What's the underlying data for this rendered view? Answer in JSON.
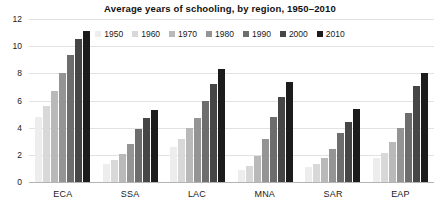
{
  "chart_data": {
    "type": "bar",
    "title": "Average years of schooling, by region, 1950–2010",
    "xlabel": "",
    "ylabel": "",
    "ylim": [
      0,
      12
    ],
    "yticks": [
      0,
      2,
      4,
      6,
      8,
      10,
      12
    ],
    "grid": true,
    "legend_position": "top-center",
    "categories": [
      "ECA",
      "SSA",
      "LAC",
      "MNA",
      "SAR",
      "EAP"
    ],
    "series": [
      {
        "name": "1950",
        "color": "#ededed",
        "values": [
          4.8,
          1.3,
          2.6,
          0.85,
          1.1,
          1.75
        ]
      },
      {
        "name": "1960",
        "color": "#d8d8d8",
        "values": [
          5.6,
          1.6,
          3.2,
          1.2,
          1.3,
          2.15
        ]
      },
      {
        "name": "1970",
        "color": "#b9b9b9",
        "values": [
          6.7,
          2.05,
          3.95,
          1.9,
          1.75,
          2.95
        ]
      },
      {
        "name": "1980",
        "color": "#949494",
        "values": [
          8.0,
          2.8,
          4.7,
          3.15,
          2.45,
          4.0
        ]
      },
      {
        "name": "1990",
        "color": "#6d6d6d",
        "values": [
          9.35,
          3.9,
          6.0,
          4.8,
          3.6,
          5.05
        ]
      },
      {
        "name": "2000",
        "color": "#464646",
        "values": [
          10.5,
          4.7,
          7.2,
          6.25,
          4.4,
          7.05
        ]
      },
      {
        "name": "2010",
        "color": "#1c1c1c",
        "values": [
          11.1,
          5.3,
          8.3,
          7.35,
          5.4,
          8.05
        ]
      }
    ]
  }
}
